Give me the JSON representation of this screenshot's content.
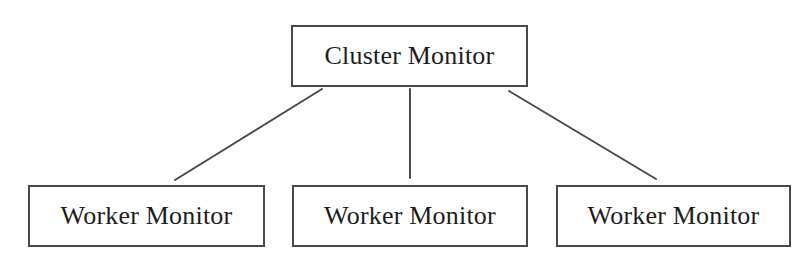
{
  "diagram": {
    "type": "hierarchy-tree",
    "background_color": "#ffffff",
    "stroke_color": "#4a4a4a",
    "text_color": "#1d1d1d",
    "nodes": [
      {
        "id": "cluster-monitor",
        "label": "Cluster Monitor",
        "role": "root",
        "x": 291,
        "y": 25,
        "width": 237,
        "height": 62
      },
      {
        "id": "worker-monitor-1",
        "label": "Worker Monitor",
        "role": "leaf",
        "x": 28,
        "y": 185,
        "width": 237,
        "height": 62
      },
      {
        "id": "worker-monitor-2",
        "label": "Worker Monitor",
        "role": "leaf",
        "x": 292,
        "y": 185,
        "width": 236,
        "height": 62
      },
      {
        "id": "worker-monitor-3",
        "label": "Worker Monitor",
        "role": "leaf",
        "x": 556,
        "y": 185,
        "width": 235,
        "height": 62
      }
    ],
    "edges": [
      {
        "id": "edge-cluster-to-worker-1",
        "from": "cluster-monitor",
        "to": "worker-monitor-1",
        "x1": 322,
        "y1": 89,
        "x2": 175,
        "y2": 180
      },
      {
        "id": "edge-cluster-to-worker-2",
        "from": "cluster-monitor",
        "to": "worker-monitor-2",
        "x1": 410,
        "y1": 89,
        "x2": 410,
        "y2": 178
      },
      {
        "id": "edge-cluster-to-worker-3",
        "from": "cluster-monitor",
        "to": "worker-monitor-3",
        "x1": 509,
        "y1": 91,
        "x2": 656,
        "y2": 179
      }
    ]
  }
}
